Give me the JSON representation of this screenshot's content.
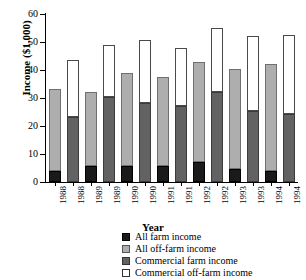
{
  "chart_data": {
    "type": "bar",
    "title": "",
    "xlabel": "Year",
    "ylabel": "Income ($1,000)",
    "ylim": [
      0,
      60
    ],
    "yticks": [
      0,
      10,
      20,
      30,
      40,
      50,
      60
    ],
    "grid": false,
    "legend_position": "bottom-right",
    "stacked": true,
    "categories": [
      "1988",
      "1988",
      "1989",
      "1989",
      "1990",
      "1990",
      "1991",
      "1991",
      "1992",
      "1992",
      "1993",
      "1993",
      "1994",
      "1994"
    ],
    "bar_groups": [
      {
        "year": "1988",
        "farm_type": "all",
        "segments": [
          {
            "name": "All farm income",
            "value": 3.8
          },
          {
            "name": "All off-farm income",
            "value": 29.5
          }
        ],
        "total": 33.3
      },
      {
        "year": "1988",
        "farm_type": "commercial",
        "segments": [
          {
            "name": "Commercial farm income",
            "value": 23.1
          },
          {
            "name": "Commercial off-farm income",
            "value": 20.6
          }
        ],
        "total": 43.7
      },
      {
        "year": "1989",
        "farm_type": "all",
        "segments": [
          {
            "name": "All farm income",
            "value": 5.7
          },
          {
            "name": "All off-farm income",
            "value": 26.5
          }
        ],
        "total": 32.2
      },
      {
        "year": "1989",
        "farm_type": "commercial",
        "segments": [
          {
            "name": "Commercial farm income",
            "value": 30.4
          },
          {
            "name": "Commercial off-farm income",
            "value": 18.4
          }
        ],
        "total": 48.8
      },
      {
        "year": "1990",
        "farm_type": "all",
        "segments": [
          {
            "name": "All farm income",
            "value": 5.6
          },
          {
            "name": "All off-farm income",
            "value": 33.2
          }
        ],
        "total": 38.8
      },
      {
        "year": "1990",
        "farm_type": "commercial",
        "segments": [
          {
            "name": "Commercial farm income",
            "value": 28.2
          },
          {
            "name": "Commercial off-farm income",
            "value": 22.7
          }
        ],
        "total": 50.9
      },
      {
        "year": "1991",
        "farm_type": "all",
        "segments": [
          {
            "name": "All farm income",
            "value": 5.7
          },
          {
            "name": "All off-farm income",
            "value": 31.7
          }
        ],
        "total": 37.4
      },
      {
        "year": "1991",
        "farm_type": "commercial",
        "segments": [
          {
            "name": "Commercial farm income",
            "value": 27.2
          },
          {
            "name": "Commercial off-farm income",
            "value": 20.8
          }
        ],
        "total": 48.0
      },
      {
        "year": "1992",
        "farm_type": "all",
        "segments": [
          {
            "name": "All farm income",
            "value": 7.0
          },
          {
            "name": "All off-farm income",
            "value": 35.7
          }
        ],
        "total": 42.7
      },
      {
        "year": "1992",
        "farm_type": "commercial",
        "segments": [
          {
            "name": "Commercial farm income",
            "value": 32.0
          },
          {
            "name": "Commercial off-farm income",
            "value": 23.1
          }
        ],
        "total": 55.1
      },
      {
        "year": "1993",
        "farm_type": "all",
        "segments": [
          {
            "name": "All farm income",
            "value": 4.7
          },
          {
            "name": "All off-farm income",
            "value": 35.5
          }
        ],
        "total": 40.2
      },
      {
        "year": "1993",
        "farm_type": "commercial",
        "segments": [
          {
            "name": "Commercial farm income",
            "value": 25.2
          },
          {
            "name": "Commercial off-farm income",
            "value": 26.9
          }
        ],
        "total": 52.1
      },
      {
        "year": "1994",
        "farm_type": "all",
        "segments": [
          {
            "name": "All farm income",
            "value": 4.1
          },
          {
            "name": "All off-farm income",
            "value": 38.0
          }
        ],
        "total": 42.1
      },
      {
        "year": "1994",
        "farm_type": "commercial",
        "segments": [
          {
            "name": "Commercial farm income",
            "value": 24.4
          },
          {
            "name": "Commercial off-farm income",
            "value": 28.1
          }
        ],
        "total": 52.5
      }
    ],
    "series": [
      {
        "name": "All farm income",
        "key": "s-allfarm",
        "color": "#1a1a1a",
        "values": [
          3.8,
          null,
          5.7,
          null,
          5.6,
          null,
          5.7,
          null,
          7.0,
          null,
          4.7,
          null,
          4.1,
          null
        ]
      },
      {
        "name": "All off-farm income",
        "key": "s-alloff",
        "color": "#aeaeae",
        "values": [
          29.5,
          null,
          26.5,
          null,
          33.2,
          null,
          31.7,
          null,
          35.7,
          null,
          35.5,
          null,
          38.0,
          null
        ]
      },
      {
        "name": "Commercial farm income",
        "key": "s-commfarm",
        "color": "#626262",
        "values": [
          null,
          23.1,
          null,
          30.4,
          null,
          28.2,
          null,
          27.2,
          null,
          32.0,
          null,
          25.2,
          null,
          24.4
        ]
      },
      {
        "name": "Commercial off-farm income",
        "key": "s-commoff",
        "color": "#ffffff",
        "values": [
          null,
          20.6,
          null,
          18.4,
          null,
          22.7,
          null,
          20.8,
          null,
          23.1,
          null,
          26.9,
          null,
          28.1
        ]
      }
    ],
    "legend": [
      {
        "label": "All farm income",
        "key": "s-allfarm"
      },
      {
        "label": "All off-farm income",
        "key": "s-alloff"
      },
      {
        "label": "Commercial farm income",
        "key": "s-commfarm"
      },
      {
        "label": "Commercial off-farm income",
        "key": "s-commoff"
      }
    ]
  }
}
